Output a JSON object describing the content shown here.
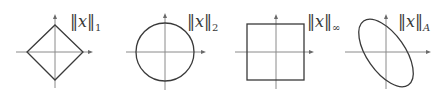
{
  "figure": {
    "panels": [
      {
        "id": "l1",
        "shape": "diamond",
        "label": {
          "norm_bars_open": "‖",
          "variable": "x",
          "norm_bars_close": "‖",
          "subscript": "1"
        }
      },
      {
        "id": "l2",
        "shape": "circle",
        "label": {
          "norm_bars_open": "‖",
          "variable": "x",
          "norm_bars_close": "‖",
          "subscript": "2"
        }
      },
      {
        "id": "linf",
        "shape": "square",
        "label": {
          "norm_bars_open": "‖",
          "variable": "x",
          "norm_bars_close": "‖",
          "subscript": "∞"
        }
      },
      {
        "id": "lA",
        "shape": "rotated-ellipse",
        "label": {
          "norm_bars_open": "‖",
          "variable": "x",
          "norm_bars_close": "‖",
          "subscript": "A"
        }
      }
    ],
    "colors": {
      "shape_stroke": "#3a3a3a",
      "axis_stroke": "#8a8a8a",
      "background": "#ffffff"
    }
  }
}
